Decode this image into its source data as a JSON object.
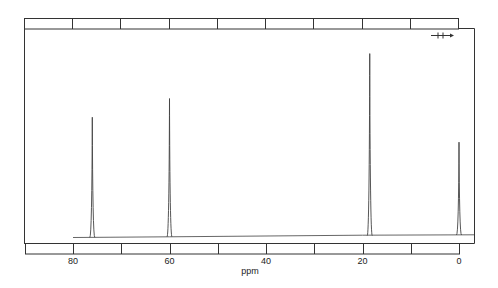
{
  "chart_data": {
    "type": "line",
    "title": "",
    "subtitle": "",
    "xlabel": "ppm",
    "ylabel": "",
    "xlim": [
      88,
      -3
    ],
    "x_reversed": true,
    "x_ticks": [
      80,
      60,
      40,
      20,
      0
    ],
    "x_tick_labels": [
      "80",
      "60",
      "40",
      "20",
      "0"
    ],
    "minor_ticks_every": 10,
    "grid": false,
    "legend": null,
    "annotations": [
      "—H→"
    ],
    "series": [
      {
        "name": "13C NMR spectrum",
        "peaks": [
          {
            "ppm": 76.0,
            "relative_height": 0.66
          },
          {
            "ppm": 60.0,
            "relative_height": 0.76
          },
          {
            "ppm": 18.5,
            "relative_height": 1.0
          },
          {
            "ppm": 0.0,
            "relative_height": 0.51
          }
        ]
      }
    ]
  },
  "axis": {
    "xlabel": "ppm",
    "tick_labels": [
      "80",
      "60",
      "40",
      "20",
      "0"
    ]
  },
  "annotation": {
    "sweep_marker": "H"
  }
}
